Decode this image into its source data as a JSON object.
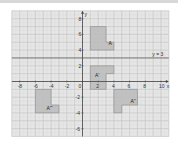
{
  "diagram": {
    "type": "coordinate-grid-transformations",
    "x_range": [
      -9,
      11
    ],
    "y_range": [
      -7,
      9
    ],
    "x_axis_label": "x",
    "y_axis_label": "y",
    "x_ticks": [
      -8,
      -6,
      -4,
      -2,
      0,
      2,
      4,
      6,
      8,
      10
    ],
    "y_ticks": [
      8,
      6,
      4,
      2,
      -2,
      -4,
      -6
    ],
    "mirror_line": {
      "label": "y = 3",
      "y": 3
    },
    "colors": {
      "grid_bg": "#e6e6e6",
      "grid_line": "#c4c4c4",
      "axis": "#444444",
      "shape_fill": "#bdbdbd",
      "shape_stroke": "#8a8a8a"
    },
    "shapes": [
      {
        "label": "A",
        "points": [
          [
            1,
            7
          ],
          [
            3,
            7
          ],
          [
            3,
            5
          ],
          [
            4,
            5
          ],
          [
            4,
            4
          ],
          [
            1,
            4
          ]
        ],
        "label_pos": [
          3.3,
          4.6
        ]
      },
      {
        "label": "A'",
        "points": [
          [
            1,
            2
          ],
          [
            4,
            2
          ],
          [
            4,
            1
          ],
          [
            3,
            1
          ],
          [
            3,
            -1
          ],
          [
            1,
            -1
          ]
        ],
        "label_pos": [
          1.6,
          0.6
        ]
      },
      {
        "label": "A''",
        "points": [
          [
            4,
            -1
          ],
          [
            7,
            -1
          ],
          [
            7,
            -3
          ],
          [
            5,
            -3
          ],
          [
            5,
            -4
          ],
          [
            4,
            -4
          ]
        ],
        "label_pos": [
          6.1,
          -2.8
        ]
      },
      {
        "label": "A'''",
        "points": [
          [
            -6,
            -1
          ],
          [
            -4,
            -1
          ],
          [
            -4,
            -3
          ],
          [
            -3,
            -3
          ],
          [
            -3,
            -4
          ],
          [
            -6,
            -4
          ]
        ],
        "label_pos": [
          -4.6,
          -3.6
        ]
      }
    ]
  }
}
